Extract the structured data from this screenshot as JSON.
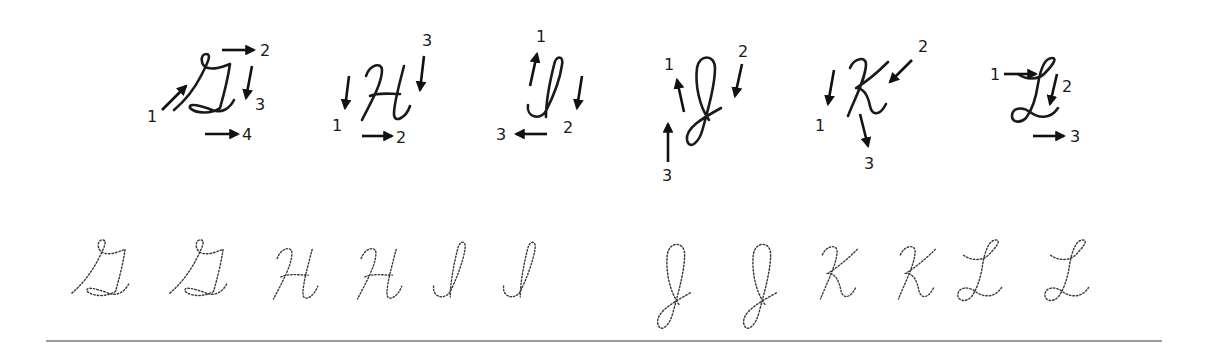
{
  "worksheet": {
    "title": "Cursive capital letters G–L stroke order practice",
    "demo_letters": [
      {
        "letter": "G",
        "steps": [
          "1",
          "2",
          "3",
          "4"
        ]
      },
      {
        "letter": "H",
        "steps": [
          "1",
          "2",
          "3"
        ]
      },
      {
        "letter": "I",
        "steps": [
          "1",
          "2",
          "3"
        ]
      },
      {
        "letter": "J",
        "steps": [
          "1",
          "2",
          "3"
        ]
      },
      {
        "letter": "K",
        "steps": [
          "1",
          "2",
          "3"
        ]
      },
      {
        "letter": "L",
        "steps": [
          "1",
          "2",
          "3"
        ]
      }
    ],
    "trace_letters": [
      "G",
      "G",
      "H",
      "H",
      "I",
      "I",
      "J",
      "J",
      "K",
      "K",
      "L",
      "L"
    ],
    "colors": {
      "ink": "#1a1a1a",
      "trace": "#3a3a3a",
      "rule": "#9a9a9a",
      "background": "#ffffff"
    }
  }
}
